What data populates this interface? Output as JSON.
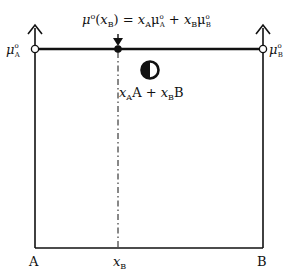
{
  "diagram": {
    "equation": {
      "lhs_mu": "μ",
      "lhs_sup": "o",
      "lhs_arg_open": "(",
      "lhs_x": "x",
      "lhs_x_sub": "B",
      "lhs_arg_close": ")",
      "equals": " = ",
      "t1_x": "x",
      "t1_x_sub": "A",
      "t1_mu": "μ",
      "t1_mu_sup": "o",
      "t1_mu_sub": "A",
      "plus": " + ",
      "t2_x": "x",
      "t2_x_sub": "B",
      "t2_mu": "μ",
      "t2_mu_sup": "o",
      "t2_mu_sub": "B"
    },
    "left_axis_label": {
      "mu": "μ",
      "sup": "o",
      "sub": "A"
    },
    "right_axis_label": {
      "mu": "μ",
      "sup": "o",
      "sub": "B"
    },
    "mixture_label": {
      "x1": "x",
      "x1_sub": "A",
      "c1": "A",
      "plus": " + ",
      "x2": "x",
      "x2_sub": "B",
      "c2": "B"
    },
    "bottom_labels": {
      "left": "A",
      "middle_x": "x",
      "middle_sub": "B",
      "right": "B"
    },
    "icons": {
      "mixture_marker": "half-filled-circle",
      "endpoint_markers": "open-circle",
      "composition_marker": "filled-circle"
    },
    "colors": {
      "line": "#111111",
      "background": "#ffffff"
    }
  }
}
